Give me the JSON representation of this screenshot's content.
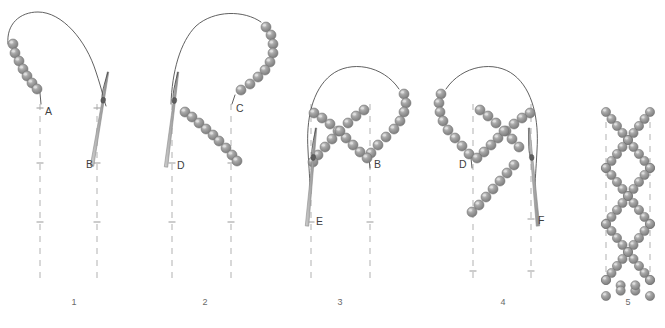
{
  "figure": {
    "background_color": "#ffffff",
    "bead_color": "#8d8d8d",
    "bead_highlight_color": "#c9c9c9",
    "bead_outline_color": "#6f6f6f",
    "thread_color": "#4f4f4f",
    "guide_line_color": "#b9b9b9",
    "needle_color": "#b0b0b0",
    "label_color": "#3f3f3f"
  },
  "panels": [
    {
      "number": "1",
      "number_x": 74,
      "number_y": 305,
      "guides": [
        {
          "x": 40,
          "y_top": 104,
          "y_bottom": 283
        },
        {
          "x": 97,
          "y_top": 104,
          "y_bottom": 283
        }
      ],
      "ticks": [
        {
          "x": 40,
          "y": 108
        },
        {
          "x": 40,
          "y": 163
        },
        {
          "x": 40,
          "y": 222
        },
        {
          "x": 97,
          "y": 108
        },
        {
          "x": 97,
          "y": 163
        },
        {
          "x": 97,
          "y": 222
        }
      ],
      "labels": [
        {
          "text": "A",
          "x": 45,
          "y": 115
        },
        {
          "text": "B",
          "x": 86,
          "y": 168
        }
      ],
      "beads": [
        {
          "cx": 13,
          "cy": 44
        },
        {
          "cx": 15,
          "cy": 53
        },
        {
          "cx": 19,
          "cy": 61
        },
        {
          "cx": 23,
          "cy": 69
        },
        {
          "cx": 27,
          "cy": 76
        },
        {
          "cx": 32,
          "cy": 83
        },
        {
          "cx": 37,
          "cy": 89
        }
      ],
      "threads": [
        "M 8 44 C 6 24 20 12 38 12 C 62 12 86 40 96 72 C 102 90 104 100 106 106",
        "M 40 93 L 41 104"
      ],
      "needle": {
        "tail_x": 108,
        "tail_y": 72,
        "tip_x": 92,
        "tip_y": 166
      }
    },
    {
      "number": "2",
      "number_x": 205,
      "number_y": 305,
      "guides": [
        {
          "x": 172,
          "y_top": 104,
          "y_bottom": 283
        },
        {
          "x": 231,
          "y_top": 104,
          "y_bottom": 283
        }
      ],
      "ticks": [
        {
          "x": 172,
          "y": 163
        },
        {
          "x": 172,
          "y": 222
        },
        {
          "x": 231,
          "y": 163
        },
        {
          "x": 231,
          "y": 222
        }
      ],
      "labels": [
        {
          "text": "C",
          "x": 236,
          "y": 112
        },
        {
          "text": "D",
          "x": 177,
          "y": 169
        }
      ],
      "beads": [
        {
          "cx": 266,
          "cy": 27
        },
        {
          "cx": 271,
          "cy": 35
        },
        {
          "cx": 273,
          "cy": 44
        },
        {
          "cx": 273,
          "cy": 53
        },
        {
          "cx": 270,
          "cy": 62
        },
        {
          "cx": 265,
          "cy": 70
        },
        {
          "cx": 258,
          "cy": 77
        },
        {
          "cx": 250,
          "cy": 84
        },
        {
          "cx": 241,
          "cy": 90
        },
        {
          "cx": 185,
          "cy": 112
        },
        {
          "cx": 192,
          "cy": 117
        },
        {
          "cx": 199,
          "cy": 123
        },
        {
          "cx": 206,
          "cy": 129
        },
        {
          "cx": 213,
          "cy": 135
        },
        {
          "cx": 219,
          "cy": 141
        },
        {
          "cx": 226,
          "cy": 148
        },
        {
          "cx": 232,
          "cy": 155
        },
        {
          "cx": 237,
          "cy": 161
        }
      ],
      "threads": [
        "M 261 22 C 244 10 214 10 196 26 C 180 42 172 72 171 104",
        "M 235 95 L 232 104"
      ],
      "needle": {
        "tail_x": 178,
        "tail_y": 72,
        "tip_x": 166,
        "tip_y": 167
      }
    },
    {
      "number": "3",
      "number_x": 340,
      "number_y": 305,
      "guides": [
        {
          "x": 311,
          "y_top": 104,
          "y_bottom": 283
        },
        {
          "x": 370,
          "y_top": 104,
          "y_bottom": 283
        }
      ],
      "ticks": [
        {
          "x": 311,
          "y": 222
        },
        {
          "x": 370,
          "y": 222
        }
      ],
      "labels": [
        {
          "text": "B",
          "x": 374,
          "y": 168
        },
        {
          "text": "E",
          "x": 316,
          "y": 225
        }
      ],
      "beads": [
        {
          "cx": 404,
          "cy": 94
        },
        {
          "cx": 406,
          "cy": 103
        },
        {
          "cx": 404,
          "cy": 112
        },
        {
          "cx": 400,
          "cy": 121
        },
        {
          "cx": 394,
          "cy": 129
        },
        {
          "cx": 386,
          "cy": 137
        },
        {
          "cx": 378,
          "cy": 145
        },
        {
          "cx": 371,
          "cy": 153
        },
        {
          "cx": 314,
          "cy": 113
        },
        {
          "cx": 322,
          "cy": 118
        },
        {
          "cx": 330,
          "cy": 124
        },
        {
          "cx": 338,
          "cy": 131
        },
        {
          "cx": 346,
          "cy": 138
        },
        {
          "cx": 353,
          "cy": 145
        },
        {
          "cx": 360,
          "cy": 152
        },
        {
          "cx": 367,
          "cy": 158
        },
        {
          "cx": 364,
          "cy": 110
        },
        {
          "cx": 356,
          "cy": 116
        },
        {
          "cx": 348,
          "cy": 123
        },
        {
          "cx": 340,
          "cy": 131
        },
        {
          "cx": 332,
          "cy": 139
        },
        {
          "cx": 325,
          "cy": 147
        },
        {
          "cx": 318,
          "cy": 155
        },
        {
          "cx": 313,
          "cy": 162
        }
      ],
      "threads": [
        "M 399 89 C 383 65 350 60 331 75 C 312 90 306 120 308 150 C 309 170 310 180 310 190",
        "M 369 158 L 370 168"
      ],
      "needle": {
        "tail_x": 316,
        "tail_y": 128,
        "tip_x": 307,
        "tip_y": 226
      }
    },
    {
      "number": "4",
      "number_x": 503,
      "number_y": 305,
      "guides": [
        {
          "x": 473,
          "y_top": 104,
          "y_bottom": 283
        },
        {
          "x": 531,
          "y_top": 104,
          "y_bottom": 283
        }
      ],
      "ticks": [
        {
          "x": 473,
          "y": 271
        },
        {
          "x": 531,
          "y": 271
        },
        {
          "x": 531,
          "y": 219
        }
      ],
      "labels": [
        {
          "text": "D",
          "x": 459,
          "y": 168
        },
        {
          "text": "F",
          "x": 538,
          "y": 224
        }
      ],
      "beads": [
        {
          "cx": 441,
          "cy": 94
        },
        {
          "cx": 439,
          "cy": 103
        },
        {
          "cx": 440,
          "cy": 112
        },
        {
          "cx": 443,
          "cy": 121
        },
        {
          "cx": 448,
          "cy": 130
        },
        {
          "cx": 455,
          "cy": 138
        },
        {
          "cx": 462,
          "cy": 146
        },
        {
          "cx": 469,
          "cy": 154
        },
        {
          "cx": 530,
          "cy": 113
        },
        {
          "cx": 522,
          "cy": 118
        },
        {
          "cx": 514,
          "cy": 124
        },
        {
          "cx": 506,
          "cy": 131
        },
        {
          "cx": 498,
          "cy": 138
        },
        {
          "cx": 491,
          "cy": 145
        },
        {
          "cx": 484,
          "cy": 152
        },
        {
          "cx": 477,
          "cy": 158
        },
        {
          "cx": 480,
          "cy": 110
        },
        {
          "cx": 488,
          "cy": 116
        },
        {
          "cx": 496,
          "cy": 123
        },
        {
          "cx": 504,
          "cy": 131
        },
        {
          "cx": 512,
          "cy": 139
        },
        {
          "cx": 519,
          "cy": 147
        },
        {
          "cx": 514,
          "cy": 165
        },
        {
          "cx": 507,
          "cy": 173
        },
        {
          "cx": 500,
          "cy": 181
        },
        {
          "cx": 493,
          "cy": 189
        },
        {
          "cx": 486,
          "cy": 197
        },
        {
          "cx": 479,
          "cy": 205
        },
        {
          "cx": 472,
          "cy": 212
        }
      ],
      "threads": [
        "M 446 89 C 462 65 495 60 514 75 C 533 90 539 120 537 150 C 536 170 535 180 535 190",
        "M 471 158 L 472 168"
      ],
      "needle": {
        "tail_x": 529,
        "tail_y": 128,
        "tip_x": 538,
        "tip_y": 226
      }
    },
    {
      "number": "5",
      "number_x": 628,
      "number_y": 305,
      "guides": [
        {
          "x": 606,
          "y_top": 110,
          "y_bottom": 283
        },
        {
          "x": 650,
          "y_top": 110,
          "y_bottom": 283
        }
      ],
      "ticks": [],
      "labels": [],
      "beads": [],
      "threads": [],
      "needle": null,
      "lattice": {
        "left_x": 606,
        "right_x": 650,
        "top_y": 112,
        "row_height": 56,
        "rows": 3,
        "description": "repeating crossed bead stitches forming a lattice"
      }
    }
  ]
}
